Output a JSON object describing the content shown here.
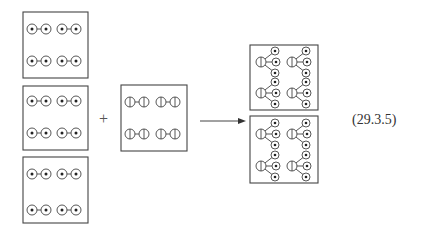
{
  "equation_number": "(29.3.5)",
  "operators": {
    "plus": "+"
  },
  "colors": {
    "stroke": "#444444",
    "dot": "#222222",
    "background": "#ffffff"
  },
  "reactants": {
    "species_a": {
      "description": "Dimer of two dotted circles (A–A)",
      "boxes": 3,
      "molecules_per_box": 4,
      "icon": "dotted-circle-dimer-icon"
    },
    "species_b": {
      "description": "Dimer of two half-split circles (B–B)",
      "boxes": 1,
      "molecules_per_box": 4,
      "icon": "split-circle-dimer-icon"
    }
  },
  "arrow": {
    "direction": "right",
    "icon": "reaction-arrow-icon"
  },
  "products": {
    "description": "Half-split circle bonded to three dotted circles (BA3)",
    "boxes": 2,
    "molecules_per_box": 4,
    "icon": "branched-molecule-icon"
  }
}
